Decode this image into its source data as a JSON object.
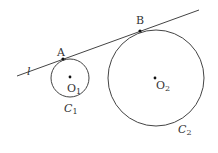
{
  "diagram": {
    "line": {
      "label": "l",
      "x1": 17,
      "y1": 76,
      "x2": 199,
      "y2": 10
    },
    "points": {
      "A": {
        "label": "A",
        "x": 63,
        "y": 59
      },
      "B": {
        "label": "B",
        "x": 140,
        "y": 31
      }
    },
    "circles": [
      {
        "name": "C1",
        "label_main": "C",
        "label_sub": "1",
        "center_label_main": "O",
        "center_label_sub": "1",
        "cx": 70,
        "cy": 78,
        "r": 19
      },
      {
        "name": "C2",
        "label_main": "C",
        "label_sub": "2",
        "center_label_main": "O",
        "center_label_sub": "2",
        "cx": 156,
        "cy": 78,
        "r": 48
      }
    ],
    "stroke_color": "#444444"
  }
}
